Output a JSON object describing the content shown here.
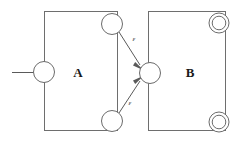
{
  "figure": {
    "type": "automaton-diagram",
    "background_color": "#ffffff",
    "line_color": "#6b6b6b",
    "label_color": "#1a1a1a"
  },
  "machines": [
    {
      "id": "A",
      "label": "A",
      "label_x": 78,
      "label_y": 77,
      "box": {
        "x": 44,
        "y": 11,
        "width": 74,
        "height": 120
      }
    },
    {
      "id": "B",
      "label": "B",
      "label_x": 190,
      "label_y": 77,
      "box": {
        "x": 148,
        "y": 11,
        "width": 78,
        "height": 120
      }
    }
  ],
  "states": [
    {
      "name": "a-start-state",
      "cx": 44,
      "cy": 72,
      "r": 11,
      "accepting": false,
      "machine": "A",
      "role": "start"
    },
    {
      "name": "a-accept-top",
      "cx": 112,
      "cy": 24,
      "r": 11,
      "accepting": false,
      "machine": "A",
      "role": "final"
    },
    {
      "name": "a-accept-bottom",
      "cx": 112,
      "cy": 121,
      "r": 11,
      "accepting": false,
      "machine": "A",
      "role": "final"
    },
    {
      "name": "b-start-state",
      "cx": 149,
      "cy": 73,
      "r": 11,
      "accepting": false,
      "machine": "B",
      "role": "start"
    },
    {
      "name": "b-accept-top",
      "cx": 219,
      "cy": 23,
      "r": 10,
      "inner_r": 7,
      "accepting": true,
      "machine": "B",
      "role": "final"
    },
    {
      "name": "b-accept-bottom",
      "cx": 219,
      "cy": 122,
      "r": 10,
      "inner_r": 7,
      "accepting": true,
      "machine": "B",
      "role": "final"
    }
  ],
  "edges": [
    {
      "name": "start-arrow",
      "from": null,
      "to": "a-start-state",
      "label": "",
      "x1": 12,
      "y1": 72,
      "x2": 33,
      "y2": 72
    },
    {
      "name": "epsilon-edge-top",
      "from": "a-accept-top",
      "to": "b-start-state",
      "label": "ε",
      "label_x": 134,
      "label_y": 41,
      "x1": 119,
      "y1": 33,
      "x2": 141,
      "y2": 66
    },
    {
      "name": "epsilon-edge-bottom",
      "from": "a-accept-bottom",
      "to": "b-start-state",
      "label": "ε",
      "label_x": 130,
      "label_y": 105,
      "x1": 119,
      "y1": 113,
      "x2": 141,
      "y2": 80
    }
  ]
}
